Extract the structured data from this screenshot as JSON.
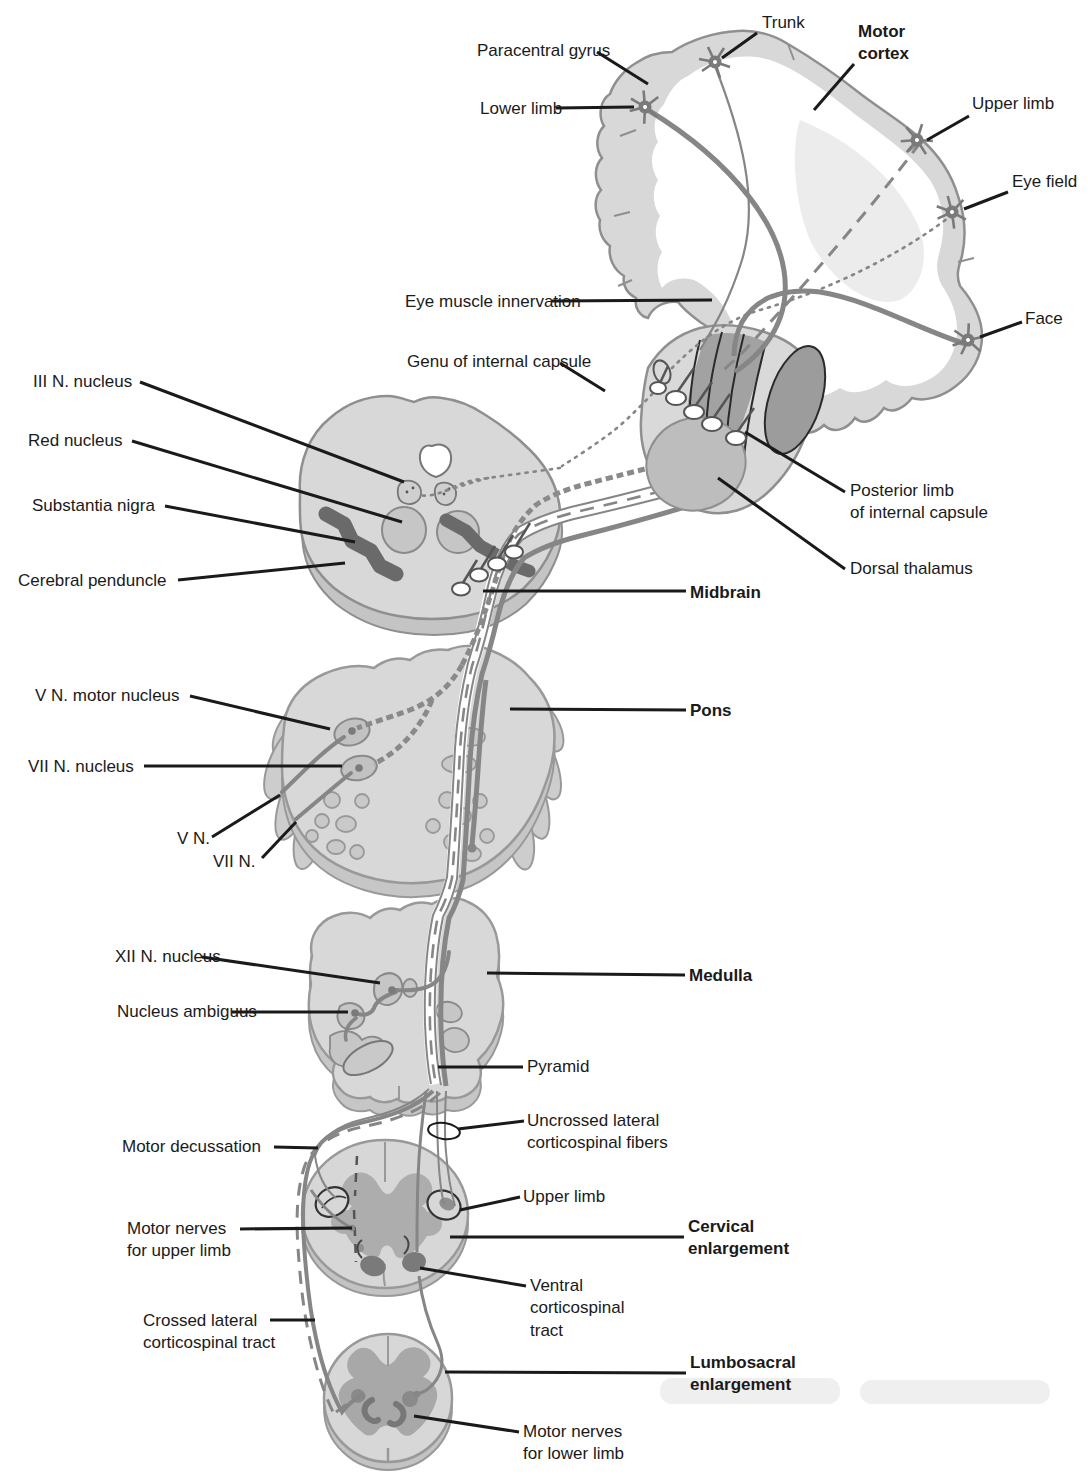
{
  "figure": {
    "type": "anatomical-diagram",
    "palette": {
      "background": "#ffffff",
      "structure_light": "#d8d8d8",
      "structure_medium": "#b0b0b0",
      "structure_dark": "#6e6e6e",
      "outline": "#8f8f8f",
      "fiber": "#868686",
      "label_text": "#1a1a1a",
      "leader_line": "#1a1a1a"
    }
  },
  "labels": {
    "cortex": {
      "paracentral_gyrus": "Paracentral gyrus",
      "trunk": "Trunk",
      "motor_cortex": "Motor\ncortex",
      "lower_limb": "Lower limb",
      "upper_limb": "Upper limb",
      "eye_field": "Eye field",
      "face": "Face",
      "eye_muscle_innervation": "Eye muscle innervation"
    },
    "capsule": {
      "genu": "Genu of internal capsule",
      "posterior_limb": "Posterior limb\nof internal capsule",
      "dorsal_thalamus": "Dorsal thalamus"
    },
    "midbrain": {
      "iii_n_nucleus": "III N. nucleus",
      "red_nucleus": "Red nucleus",
      "substantia_nigra": "Substantia nigra",
      "cerebral_peduncle": "Cerebral penduncle",
      "midbrain": "Midbrain"
    },
    "pons": {
      "v_n_motor_nucleus": "V N. motor nucleus",
      "vii_n_nucleus": "VII N. nucleus",
      "v_n": "V N.",
      "vii_n": "VII N.",
      "pons": "Pons"
    },
    "medulla": {
      "xii_n_nucleus": "XII N. nucleus",
      "nucleus_ambiguus": "Nucleus ambiguus",
      "medulla": "Medulla",
      "pyramid": "Pyramid"
    },
    "spinal": {
      "motor_decussation": "Motor decussation",
      "uncrossed_fibers": "Uncrossed lateral\ncorticospinal fibers",
      "upper_limb": "Upper limb",
      "cervical_enlargement": "Cervical\nenlargement",
      "motor_nerves_upper": "Motor nerves\nfor upper limb",
      "ventral_tract": "Ventral\ncorticospinal\ntract",
      "crossed_tract": "Crossed lateral\ncorticospinal tract",
      "lumbosacral_enlargement": "Lumbosacral\nenlargement",
      "motor_nerves_lower": "Motor nerves\nfor lower limb"
    }
  }
}
